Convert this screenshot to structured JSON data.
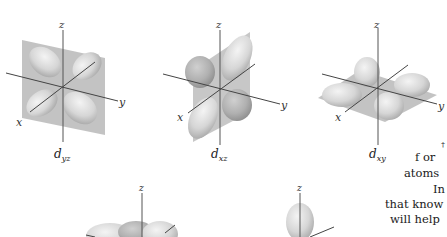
{
  "figure": {
    "orbitals": [
      {
        "id": "dyz",
        "label_main": "d",
        "label_sub": "yz",
        "axes": {
          "z": "z",
          "x": "x",
          "y": "y"
        }
      },
      {
        "id": "dxz",
        "label_main": "d",
        "label_sub": "xz",
        "axes": {
          "z": "z",
          "x": "x",
          "y": "y"
        }
      },
      {
        "id": "dxy",
        "label_main": "d",
        "label_sub": "xy",
        "axes": {
          "z": "z",
          "x": "x",
          "y": "y"
        }
      },
      {
        "id": "dx2y2",
        "axes": {
          "z": "z"
        }
      },
      {
        "id": "dz2",
        "axes": {
          "z": "z"
        }
      }
    ]
  },
  "text": {
    "lines": [
      "f or",
      "atoms",
      "In",
      "that know",
      "will help"
    ],
    "fragment": "†"
  },
  "colors": {
    "plane": "#b8b8b8",
    "lobe": "#d9d9d9",
    "lobe_shadow": "#a8a8a8",
    "axis": "#555555"
  }
}
